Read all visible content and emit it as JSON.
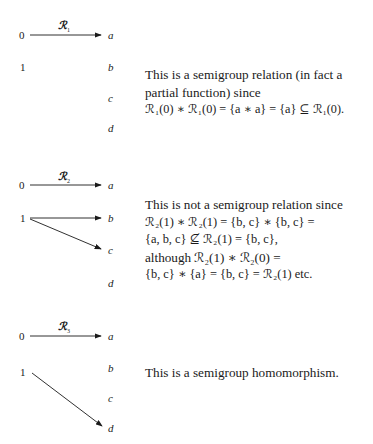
{
  "figure": {
    "panels": [
      {
        "relation_label": "ℛ",
        "relation_index": "1",
        "domain_nodes": [
          "0",
          "1"
        ],
        "codomain_nodes": [
          "a",
          "b",
          "c",
          "d"
        ],
        "arrows": [
          {
            "from": "0",
            "to": "a"
          }
        ],
        "text_lines": [
          "This is a semigroup relation (in fact a",
          "partial function) since",
          "ℛ₁(0) ∗ ℛ₁(0) = {a ∗ a} = {a} ⊆ ℛ₁(0)."
        ]
      },
      {
        "relation_label": "ℛ",
        "relation_index": "2",
        "domain_nodes": [
          "0",
          "1"
        ],
        "codomain_nodes": [
          "a",
          "b",
          "c",
          "d"
        ],
        "arrows": [
          {
            "from": "0",
            "to": "a"
          },
          {
            "from": "1",
            "to": "b"
          },
          {
            "from": "1",
            "to": "c"
          }
        ],
        "text_lines": [
          "This is not a semigroup relation since",
          "ℛ₂(1) ∗ ℛ₂(1) = {b, c} ∗ {b, c} =",
          "{a, b, c} ⊈ ℛ₂(1) = {b, c},",
          "although ℛ₂(1) ∗ ℛ₂(0) =",
          "{b, c} ∗ {a} = {b, c} = ℛ₂(1) etc."
        ]
      },
      {
        "relation_label": "ℛ",
        "relation_index": "3",
        "domain_nodes": [
          "0",
          "1"
        ],
        "codomain_nodes": [
          "a",
          "b",
          "c",
          "d"
        ],
        "arrows": [
          {
            "from": "0",
            "to": "a"
          },
          {
            "from": "1",
            "to": "d"
          }
        ],
        "text_lines": [
          "This is a semigroup homomorphism."
        ]
      }
    ]
  }
}
